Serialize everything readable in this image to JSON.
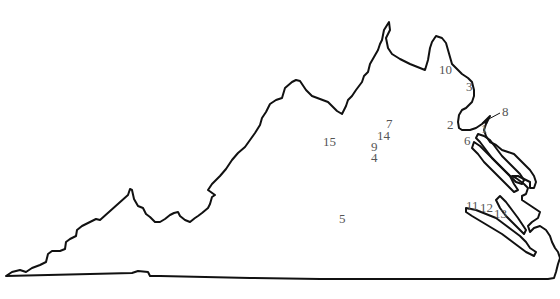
{
  "map": {
    "title": "Virginia",
    "region": "Virginia state outline",
    "label_color": "#555555",
    "outline_color": "#111111",
    "labels": [
      {
        "id": "1",
        "text": "1"
      },
      {
        "id": "2",
        "text": "2"
      },
      {
        "id": "3",
        "text": "3"
      },
      {
        "id": "4",
        "text": "4"
      },
      {
        "id": "5",
        "text": "5"
      },
      {
        "id": "6",
        "text": "6"
      },
      {
        "id": "7",
        "text": "7"
      },
      {
        "id": "8",
        "text": "8"
      },
      {
        "id": "9",
        "text": "9"
      },
      {
        "id": "10",
        "text": "10"
      },
      {
        "id": "11",
        "text": "11"
      },
      {
        "id": "12",
        "text": "12"
      },
      {
        "id": "13",
        "text": "13"
      },
      {
        "id": "14",
        "text": "14"
      },
      {
        "id": "15",
        "text": "15"
      }
    ]
  }
}
